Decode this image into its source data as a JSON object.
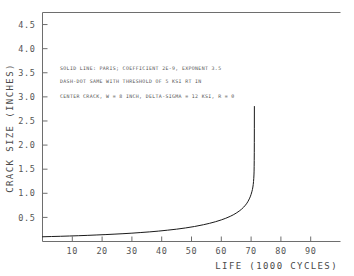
{
  "chart_data": {
    "type": "line",
    "title": "",
    "xlabel": "LIFE (1000 CYCLES)",
    "ylabel": "CRACK SIZE (INCHES)",
    "xlim": [
      0,
      100
    ],
    "ylim": [
      0,
      4.75
    ],
    "grid": false,
    "legend": "none",
    "xticks": [
      10,
      20,
      30,
      40,
      50,
      60,
      70,
      80,
      90
    ],
    "xtick_labels": [
      "10",
      "20",
      "30",
      "40",
      "50",
      "60",
      "70",
      "80",
      "90"
    ],
    "yticks": [
      0.5,
      1.0,
      1.5,
      2.0,
      2.5,
      3.0,
      3.5,
      4.0,
      4.5
    ],
    "ytick_labels": [
      "0.5",
      "1.0",
      "1.5",
      "2.0",
      "2.5",
      "3.0",
      "3.5",
      "4.0",
      "4.5"
    ],
    "annotations": [
      "SOLID LINE: PARIS; COEFFICIENT 2E-9, EXPONENT 3.5",
      "DASH-DOT SAME WITH THRESHOLD OF 5 KSI RT IN",
      "CENTER CRACK, W = 8 INCH, DELTA-SIGMA = 12 KSI, R = 0"
    ],
    "series": [
      {
        "name": "Paris law crack growth",
        "style": "solid",
        "color": "#1a1a1a",
        "x": [
          0.0,
          3.0,
          6.0,
          9.0,
          12.0,
          15.0,
          18.0,
          21.0,
          24.0,
          27.0,
          30.0,
          33.0,
          36.0,
          39.0,
          42.0,
          45.0,
          48.0,
          51.0,
          54.0,
          56.0,
          58.0,
          60.0,
          61.5,
          63.0,
          64.0,
          65.0,
          66.0,
          66.8,
          67.5,
          68.1,
          68.6,
          69.0,
          69.4,
          69.7,
          70.0,
          70.25,
          70.45,
          70.6,
          70.72,
          70.82,
          70.9,
          70.96,
          71.0,
          71.03,
          71.05,
          71.07,
          71.08,
          71.09,
          71.1
        ],
        "y": [
          0.098,
          0.103,
          0.108,
          0.114,
          0.12,
          0.127,
          0.135,
          0.143,
          0.152,
          0.162,
          0.173,
          0.186,
          0.2,
          0.216,
          0.235,
          0.256,
          0.281,
          0.311,
          0.348,
          0.376,
          0.409,
          0.448,
          0.482,
          0.522,
          0.553,
          0.589,
          0.631,
          0.67,
          0.712,
          0.754,
          0.795,
          0.836,
          0.884,
          0.926,
          0.978,
          1.03,
          1.08,
          1.13,
          1.185,
          1.245,
          1.31,
          1.38,
          1.46,
          1.56,
          1.68,
          1.85,
          2.05,
          2.35,
          2.8
        ]
      }
    ]
  },
  "axes": {
    "y_title": "CRACK SIZE (INCHES)",
    "x_title": "LIFE (1000 CYCLES)"
  }
}
